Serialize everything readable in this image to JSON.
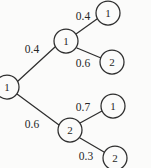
{
  "diagram": {
    "type": "probability-tree",
    "background_color": "#fbfbfa",
    "stroke_color": "#2e2e2e",
    "text_color": "#262626",
    "nodes": [
      {
        "id": "root",
        "label": "1",
        "cx": 7,
        "cy": 87,
        "r": 12
      },
      {
        "id": "n-a",
        "label": "1",
        "cx": 66,
        "cy": 41,
        "r": 12
      },
      {
        "id": "n-b",
        "label": "2",
        "cx": 70,
        "cy": 130,
        "r": 12
      },
      {
        "id": "n-a1",
        "label": "1",
        "cx": 108,
        "cy": 13,
        "r": 12
      },
      {
        "id": "n-a2",
        "label": "2",
        "cx": 112,
        "cy": 62,
        "r": 12
      },
      {
        "id": "n-b1",
        "label": "1",
        "cx": 113,
        "cy": 106,
        "r": 12
      },
      {
        "id": "n-b2",
        "label": "2",
        "cx": 115,
        "cy": 158,
        "r": 12
      }
    ],
    "edges": [
      {
        "id": "e-root-a",
        "from": "root",
        "to": "n-a",
        "label": "0.4",
        "x1": 18,
        "y1": 81,
        "x2": 55,
        "y2": 47,
        "lx": 32,
        "ly": 49
      },
      {
        "id": "e-root-b",
        "from": "root",
        "to": "n-b",
        "label": "0.6",
        "x1": 17,
        "y1": 94,
        "x2": 59,
        "y2": 125,
        "lx": 32,
        "ly": 124
      },
      {
        "id": "e-a-a1",
        "from": "n-a",
        "to": "n-a1",
        "label": "0.4",
        "x1": 76,
        "y1": 34,
        "x2": 97,
        "y2": 19,
        "lx": 83,
        "ly": 16
      },
      {
        "id": "e-a-a2",
        "from": "n-a",
        "to": "n-a2",
        "label": "0.6",
        "x1": 77,
        "y1": 48,
        "x2": 101,
        "y2": 58,
        "lx": 83,
        "ly": 63
      },
      {
        "id": "e-b-b1",
        "from": "n-b",
        "to": "n-b1",
        "label": "0.7",
        "x1": 80,
        "y1": 123,
        "x2": 102,
        "y2": 111,
        "lx": 83,
        "ly": 107
      },
      {
        "id": "e-b-b2",
        "from": "n-b",
        "to": "n-b2",
        "label": "0.3",
        "x1": 80,
        "y1": 138,
        "x2": 104,
        "y2": 152,
        "lx": 86,
        "ly": 156
      }
    ]
  }
}
